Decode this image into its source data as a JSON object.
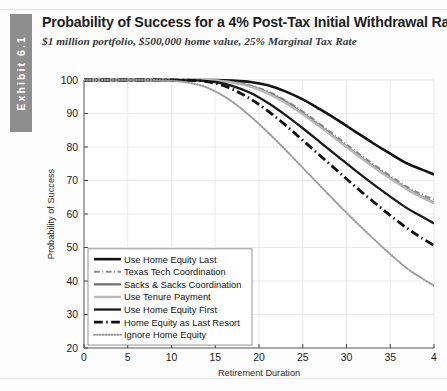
{
  "exhibit": {
    "label": "Exhibit 6.1"
  },
  "header": {
    "title": "Probability of Success for a 4% Post-Tax Initial Withdrawal Rate",
    "subtitle": "$1 million portfolio, $500,000 home value, 25% Marginal Tax Rate"
  },
  "chart_data": {
    "type": "line",
    "title": "Probability of Success for a 4% Post-Tax Initial Withdrawal Rate",
    "subtitle": "$1 million portfolio, $500,000 home value, 25% Marginal Tax Rate",
    "xlabel": "Retirement Duration",
    "ylabel": "Probability of Success",
    "xlim": [
      0,
      40
    ],
    "ylim": [
      20,
      100
    ],
    "xticks": [
      0,
      5,
      10,
      15,
      20,
      25,
      30,
      35,
      40
    ],
    "xtick_labels": [
      "0",
      "5",
      "10",
      "15",
      "20",
      "25",
      "30",
      "35",
      "4"
    ],
    "yticks": [
      20,
      30,
      40,
      50,
      60,
      70,
      80,
      90,
      100
    ],
    "ytick_labels": [
      "20",
      "30",
      "40",
      "50",
      "60",
      "70",
      "80",
      "90",
      "100"
    ],
    "grid": true,
    "legend_position": "lower-left-inside",
    "x": [
      0,
      5,
      10,
      13,
      15,
      17,
      19,
      21,
      23,
      25,
      27,
      29,
      31,
      33,
      35,
      37,
      38.5,
      40
    ],
    "series": [
      {
        "name": "Use Home Equity Last",
        "style": "solid",
        "color": "#111111",
        "width": 2.6,
        "values": [
          100,
          100,
          100,
          100,
          100,
          99.8,
          99.4,
          98.4,
          96.6,
          94.2,
          91.2,
          88.0,
          84.6,
          81.2,
          78.0,
          75.0,
          73.4,
          71.8
        ]
      },
      {
        "name": "Texas Tech Coordination",
        "style": "dashdot",
        "color": "#8c8c8c",
        "width": 1.9,
        "values": [
          100,
          100,
          100,
          100,
          99.9,
          99.4,
          98.4,
          96.6,
          94.0,
          90.6,
          86.8,
          82.8,
          78.8,
          75.0,
          71.4,
          68.0,
          66.0,
          64.2
        ]
      },
      {
        "name": "Sacks & Sacks Coordination",
        "style": "solid",
        "color": "#6d6d6d",
        "width": 2.2,
        "values": [
          100,
          100,
          100,
          100,
          99.9,
          99.3,
          98.2,
          96.2,
          93.5,
          90.0,
          86.2,
          82.2,
          78.2,
          74.4,
          70.8,
          67.4,
          65.3,
          63.4
        ]
      },
      {
        "name": "Use Tenure Payment",
        "style": "solid",
        "color": "#b9b9b9",
        "width": 2.4,
        "values": [
          100,
          100,
          100,
          100,
          99.9,
          99.2,
          98.0,
          96.0,
          93.2,
          89.8,
          86.0,
          82.0,
          78.0,
          74.2,
          70.6,
          67.2,
          65.1,
          63.2
        ]
      },
      {
        "name": "Use Home Equity First",
        "style": "solid",
        "color": "#1a1a1a",
        "width": 2.3,
        "values": [
          100,
          100,
          100,
          99.9,
          99.4,
          98.2,
          96.2,
          93.2,
          89.6,
          85.6,
          81.4,
          77.2,
          73.0,
          69.0,
          65.2,
          61.6,
          59.4,
          57.2
        ]
      },
      {
        "name": "Home Equity as Last Resort",
        "style": "dashdot",
        "color": "#111111",
        "width": 2.8,
        "values": [
          100,
          100,
          100,
          99.8,
          99.0,
          97.2,
          94.4,
          90.8,
          86.6,
          82.0,
          77.4,
          72.8,
          68.2,
          63.8,
          59.6,
          55.6,
          53.0,
          50.6
        ]
      },
      {
        "name": "Ignore Home Equity",
        "style": "dotted",
        "color": "#9a9a9a",
        "width": 2.0,
        "values": [
          100,
          100,
          99.8,
          98.6,
          96.6,
          93.4,
          89.2,
          84.4,
          79.2,
          73.8,
          68.4,
          63.0,
          57.8,
          52.8,
          48.0,
          43.6,
          41.0,
          38.6
        ]
      }
    ],
    "legend": [
      "Use Home Equity Last",
      "Texas Tech Coordination",
      "Sacks & Sacks Coordination",
      "Use Tenure Payment",
      "Use Home Equity First",
      "Home Equity as Last Resort",
      "Ignore Home Equity"
    ]
  }
}
